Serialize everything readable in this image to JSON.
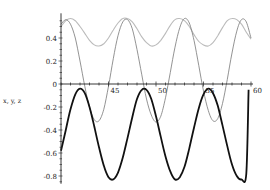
{
  "chart_data": {
    "type": "line",
    "title": "",
    "xlabel": "",
    "ylabel": "x, y, z",
    "xlim": [
      40,
      60
    ],
    "ylim": [
      -0.85,
      0.58
    ],
    "grid": false,
    "legend": "none",
    "x_ticks": [
      45,
      50,
      55,
      60
    ],
    "y_ticks": [
      -0.8,
      -0.6,
      -0.4,
      -0.2,
      0,
      0.2,
      0.4
    ],
    "y_tick_labels": [
      "-0.8",
      "-0.6",
      "-0.4",
      "-0.2",
      "0",
      "0.2",
      "0.4"
    ],
    "x_tick_labels": [
      "45",
      "50",
      "55",
      "60"
    ],
    "series": [
      {
        "name": "x",
        "style": "thick-black",
        "color": "#111111",
        "x": [
          40.0,
          40.5,
          41.0,
          41.5,
          42.0,
          42.5,
          43.0,
          43.5,
          44.0,
          44.5,
          45.0,
          45.5,
          46.0,
          46.5,
          47.0,
          47.5,
          48.0,
          48.5,
          49.0,
          49.5,
          50.0,
          50.5,
          51.0,
          51.5,
          52.0,
          52.5,
          53.0,
          53.5,
          54.0,
          54.5,
          55.0,
          55.5,
          56.0,
          56.5,
          57.0,
          57.5,
          58.0,
          58.5,
          59.0,
          59.5,
          60.0
        ],
        "y": [
          -0.58,
          -0.4,
          -0.22,
          -0.09,
          -0.04,
          -0.08,
          -0.2,
          -0.37,
          -0.55,
          -0.71,
          -0.81,
          -0.83,
          -0.77,
          -0.64,
          -0.47,
          -0.29,
          -0.13,
          -0.05,
          -0.05,
          -0.13,
          -0.28,
          -0.46,
          -0.63,
          -0.76,
          -0.83,
          -0.81,
          -0.72,
          -0.56,
          -0.38,
          -0.21,
          -0.09,
          -0.04,
          -0.08,
          -0.19,
          -0.36,
          -0.54,
          -0.7,
          -0.8,
          -0.83,
          -0.78,
          -0.04
        ]
      },
      {
        "name": "y",
        "style": "thin-gray",
        "color": "#777777",
        "x": [
          40.0,
          40.5,
          41.0,
          41.5,
          42.0,
          42.5,
          43.0,
          43.5,
          44.0,
          44.5,
          45.0,
          45.5,
          46.0,
          46.5,
          47.0,
          47.5,
          48.0,
          48.5,
          49.0,
          49.5,
          50.0,
          50.5,
          51.0,
          51.5,
          52.0,
          52.5,
          53.0,
          53.5,
          54.0,
          54.5,
          55.0,
          55.5,
          56.0,
          56.5,
          57.0,
          57.5,
          58.0,
          58.5,
          59.0,
          59.5,
          60.0
        ],
        "y": [
          0.52,
          0.56,
          0.52,
          0.4,
          0.2,
          -0.02,
          -0.2,
          -0.31,
          -0.32,
          -0.22,
          -0.02,
          0.22,
          0.42,
          0.54,
          0.56,
          0.48,
          0.3,
          0.08,
          -0.13,
          -0.27,
          -0.33,
          -0.28,
          -0.12,
          0.1,
          0.32,
          0.49,
          0.57,
          0.53,
          0.38,
          0.16,
          -0.06,
          -0.23,
          -0.32,
          -0.3,
          -0.17,
          0.04,
          0.27,
          0.46,
          0.56,
          0.54,
          0.4
        ]
      },
      {
        "name": "z",
        "style": "thin-lightgray",
        "color": "#bbbbbb",
        "x": [
          40.0,
          40.5,
          41.0,
          41.5,
          42.0,
          42.5,
          43.0,
          43.5,
          44.0,
          44.5,
          45.0,
          45.5,
          46.0,
          46.5,
          47.0,
          47.5,
          48.0,
          48.5,
          49.0,
          49.5,
          50.0,
          50.5,
          51.0,
          51.5,
          52.0,
          52.5,
          53.0,
          53.5,
          54.0,
          54.5,
          55.0,
          55.5,
          56.0,
          56.5,
          57.0,
          57.5,
          58.0,
          58.5,
          59.0,
          59.5,
          60.0
        ],
        "y": [
          0.5,
          0.55,
          0.57,
          0.55,
          0.5,
          0.44,
          0.38,
          0.34,
          0.33,
          0.35,
          0.4,
          0.47,
          0.53,
          0.57,
          0.57,
          0.54,
          0.48,
          0.41,
          0.36,
          0.33,
          0.34,
          0.38,
          0.44,
          0.51,
          0.56,
          0.57,
          0.55,
          0.5,
          0.43,
          0.37,
          0.34,
          0.33,
          0.36,
          0.42,
          0.49,
          0.55,
          0.57,
          0.56,
          0.52,
          0.45,
          0.39
        ]
      }
    ]
  },
  "axes": {
    "ylabel": "x, y, z"
  }
}
